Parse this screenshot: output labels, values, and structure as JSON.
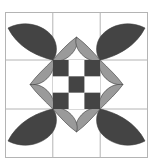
{
  "artwork": {
    "title": "Quilt block pattern",
    "kind": "geometric-quilt-block",
    "caption": ""
  },
  "canvas": {
    "width": 153,
    "height": 168,
    "background_color": "#ffffff"
  },
  "frame": {
    "x": 5,
    "y": 12,
    "width": 143,
    "height": 146,
    "border_color": "#b4b4b4",
    "fill_color": "#ffffff"
  },
  "grid": {
    "rows": 3,
    "cols": 3,
    "line_color": "#b4b4b4",
    "line_width": 1,
    "visible": true
  },
  "palette": {
    "dark": "#444444",
    "gray": "#9a9a9a",
    "white": "#ffffff",
    "outline": "#3a3a3a",
    "grid_line": "#b4b4b4"
  },
  "petals": {
    "corner_label": "dark-corner-petal",
    "ring_label": "gray-ring-petal",
    "corner_count": 4,
    "ring_count": 8,
    "corner_color": "#444444",
    "ring_color": "#9a9a9a",
    "corner_positions": [
      "top-left",
      "top-right",
      "bottom-left",
      "bottom-right"
    ],
    "ring_positions": [
      "top-left-in",
      "top-right-in",
      "right-top-in",
      "right-bottom-in",
      "bottom-right-in",
      "bottom-left-in",
      "left-bottom-in",
      "left-top-in"
    ]
  },
  "checkerboard": {
    "rows": 3,
    "cols": 3,
    "cell_size": 19,
    "origin_x": 52,
    "origin_y": 49,
    "cells": [
      [
        "dark",
        "white",
        "dark"
      ],
      [
        "white",
        "dark",
        "white"
      ],
      [
        "dark",
        "white",
        "dark"
      ]
    ]
  }
}
